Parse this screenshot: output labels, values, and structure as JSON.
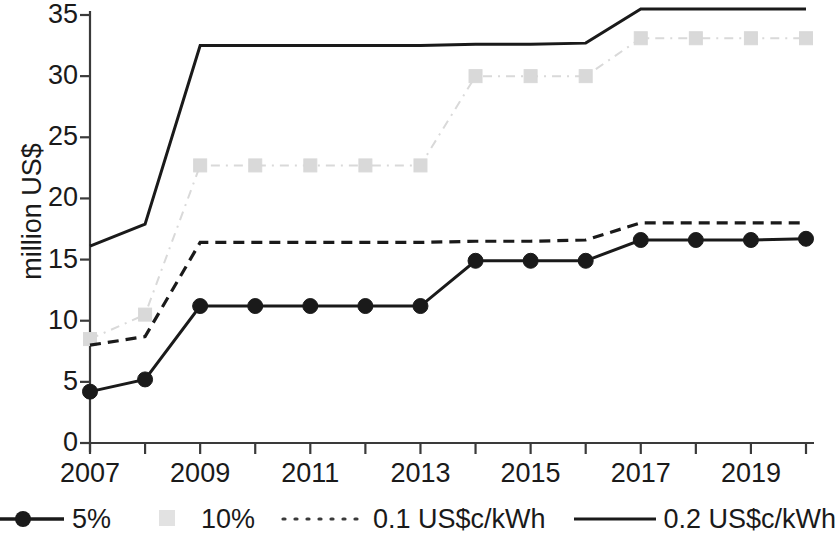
{
  "chart_data": {
    "type": "line",
    "title": "",
    "xlabel": "",
    "ylabel": "million US$",
    "x": [
      2007,
      2008,
      2009,
      2010,
      2011,
      2012,
      2013,
      2014,
      2015,
      2016,
      2017,
      2018,
      2019,
      2020
    ],
    "xtick_labels": [
      "2007",
      "2009",
      "2011",
      "2013",
      "2015",
      "2017",
      "2019"
    ],
    "xtick_values": [
      2007,
      2009,
      2011,
      2013,
      2015,
      2017,
      2019
    ],
    "ytick_labels": [
      "0",
      "5",
      "10",
      "15",
      "20",
      "25",
      "30",
      "35"
    ],
    "ytick_values": [
      0,
      5,
      10,
      15,
      20,
      25,
      30,
      35
    ],
    "xlim": [
      2007,
      2020
    ],
    "ylim": [
      0,
      35
    ],
    "grid": false,
    "legend_position": "bottom",
    "series": [
      {
        "name": "5%",
        "color": "#1a1a1a",
        "style": "solid-marker",
        "marker": "circle",
        "values": [
          4.2,
          5.2,
          11.2,
          11.2,
          11.2,
          11.2,
          11.2,
          14.9,
          14.9,
          14.9,
          16.6,
          16.6,
          16.6,
          16.7
        ]
      },
      {
        "name": "10%",
        "color": "#d9d9d9",
        "style": "dashdot-marker",
        "marker": "square",
        "values": [
          8.5,
          10.5,
          22.7,
          22.7,
          22.7,
          22.7,
          22.7,
          30.0,
          30.0,
          30.0,
          33.1,
          33.1,
          33.1,
          33.1
        ]
      },
      {
        "name": "0.1 US$c/kWh",
        "color": "#1a1a1a",
        "style": "dashed",
        "marker": "none",
        "values": [
          8.0,
          8.7,
          16.4,
          16.4,
          16.4,
          16.4,
          16.4,
          16.5,
          16.5,
          16.6,
          18.0,
          18.0,
          18.0,
          18.0
        ]
      },
      {
        "name": "0.2 US$c/kWh",
        "color": "#1a1a1a",
        "style": "solid",
        "marker": "none",
        "values": [
          16.1,
          17.9,
          32.5,
          32.5,
          32.5,
          32.5,
          32.5,
          32.6,
          32.6,
          32.7,
          35.5,
          35.5,
          35.5,
          35.5
        ]
      }
    ]
  },
  "legend": [
    {
      "label": "5%",
      "swatch": "line-circle-marker"
    },
    {
      "label": "10%",
      "swatch": "gray-square-marker"
    },
    {
      "label": "0.1 US$c/kWh",
      "swatch": "dotted-line"
    },
    {
      "label": "0.2 US$c/kWh",
      "swatch": "solid-line"
    }
  ],
  "axis": {
    "y_title": "million US$"
  }
}
